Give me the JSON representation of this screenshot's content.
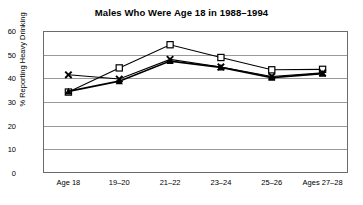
{
  "chart_data": {
    "type": "line",
    "title": "Males Who Were Age 18 in 1988–1994",
    "xlabel": "",
    "ylabel": "% Reporting Heavy Drinking",
    "categories": [
      "Age 18",
      "19–20",
      "21–22",
      "23–24",
      "25–26",
      "Ages 27–28"
    ],
    "ylim": [
      0,
      60
    ],
    "yticks": [
      0,
      10,
      20,
      30,
      40,
      50,
      60
    ],
    "grid": true,
    "legend": "none",
    "series": [
      {
        "name": "series-square",
        "marker": "open-square",
        "color": "#000000",
        "values": [
          34.2,
          44.4,
          54.2,
          48.8,
          43.6,
          43.8
        ]
      },
      {
        "name": "series-triangle",
        "marker": "filled-triangle",
        "color": "#000000",
        "values": [
          34.5,
          38.8,
          47.3,
          44.6,
          40.3,
          42.0
        ]
      },
      {
        "name": "series-x",
        "marker": "x-cross",
        "color": "#000000",
        "values": [
          41.5,
          39.7,
          48.0,
          44.8,
          40.8,
          42.3
        ]
      }
    ]
  },
  "axis": {
    "y_tick_labels": [
      "60",
      "50",
      "40",
      "30",
      "20",
      "10",
      "0"
    ],
    "y_label_text": "% Reporting Heavy Drinking"
  }
}
